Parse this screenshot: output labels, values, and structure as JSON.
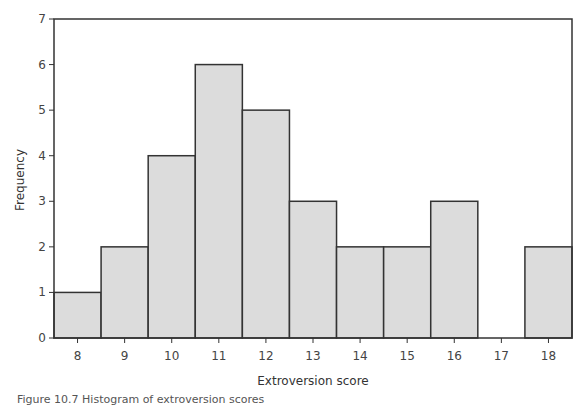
{
  "chart_data": {
    "type": "bar",
    "subtype": "histogram",
    "title": "",
    "xlabel": "Extroversion score",
    "ylabel": "Frequency",
    "categories": [
      "8",
      "9",
      "10",
      "11",
      "12",
      "13",
      "14",
      "15",
      "16",
      "17",
      "18"
    ],
    "values": [
      1,
      2,
      4,
      6,
      5,
      3,
      2,
      2,
      3,
      0,
      2
    ],
    "yticks": [
      0,
      1,
      2,
      3,
      4,
      5,
      6,
      7
    ],
    "ylim": [
      0,
      7
    ],
    "grid": false,
    "legend": null,
    "bar_color": "#dcdcdc",
    "edge_color": "#333333"
  },
  "caption": "Figure 10.7 Histogram of extroversion scores"
}
